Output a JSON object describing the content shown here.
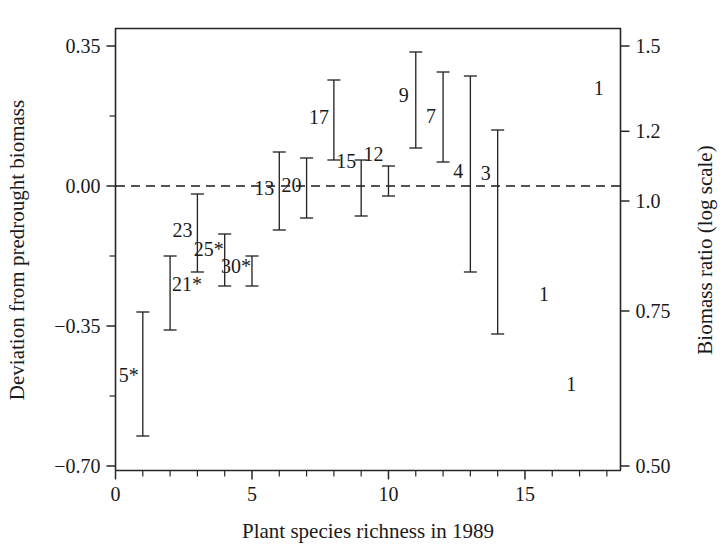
{
  "figure": {
    "background": "#ffffff",
    "ink_color": "#1a1a1a",
    "x_axis_title": "Plant species richness in 1989",
    "y_axis_title_left": "Deviation from predrought biomass",
    "y_axis_title_right": "Biomass ratio (log scale)"
  },
  "chart_data": {
    "type": "scatter",
    "title": "",
    "xlabel": "Plant species richness in 1989",
    "ylabel": "Deviation from predrought biomass",
    "ylabel_secondary": "Biomass ratio (log scale)",
    "xlim": [
      0,
      18.5
    ],
    "ylim": [
      -0.7,
      0.35
    ],
    "ylim_secondary": [
      0.5,
      1.5
    ],
    "grid": false,
    "legend": false,
    "reference_line": {
      "y": 0.0,
      "style": "dashed",
      "label": "0.00 / biomass ratio 1.0"
    },
    "xticks": [
      0,
      5,
      10,
      15
    ],
    "xtick_labels": [
      "0",
      "5",
      "10",
      "15"
    ],
    "xtick_minor_step": 1,
    "yticks_left": [
      0.35,
      0.0,
      -0.35,
      -0.7
    ],
    "ytick_labels_left": [
      "0.35",
      "0.00",
      "−0.35",
      "−0.70"
    ],
    "yticks_minor_left": [
      0.175,
      -0.175,
      -0.525
    ],
    "yticks_right": [
      1.5,
      1.2,
      1.0,
      0.75,
      0.5
    ],
    "ytick_labels_right": [
      "1.5",
      "1.2",
      "1.0",
      "0.75",
      "0.50"
    ],
    "point_label_note": "Numeric labels next to each error bar are plot/field identifiers; asterisks mark significance.",
    "points": [
      {
        "id": "5*",
        "label": "5*",
        "x": 1,
        "mean": -0.475,
        "low": -0.625,
        "high": -0.315,
        "label_dx": -14,
        "label_dy": 8
      },
      {
        "id": "21*",
        "label": "21*",
        "x": 2,
        "mean": -0.265,
        "low": -0.36,
        "high": -0.175,
        "label_dx": 17,
        "label_dy": -2
      },
      {
        "id": "23",
        "label": "23",
        "x": 3,
        "mean": -0.12,
        "low": -0.215,
        "high": -0.02,
        "label_dx": -15,
        "label_dy": 4
      },
      {
        "id": "25*",
        "label": "25*",
        "x": 4,
        "mean": -0.19,
        "low": -0.25,
        "high": -0.12,
        "label_dx": -16,
        "label_dy": -4
      },
      {
        "id": "30*",
        "label": "30*",
        "x": 5,
        "mean": -0.215,
        "low": -0.25,
        "high": -0.175,
        "label_dx": -16,
        "label_dy": 2
      },
      {
        "id": "13",
        "label": "13",
        "x": 6,
        "mean": 0.0,
        "low": -0.11,
        "high": 0.085,
        "label_dx": -15,
        "label_dy": 4
      },
      {
        "id": "20",
        "label": "20",
        "x": 7,
        "mean": 0.0,
        "low": -0.08,
        "high": 0.07,
        "label_dx": -15,
        "label_dy": 4
      },
      {
        "id": "17",
        "label": "17",
        "x": 8,
        "mean": 0.16,
        "low": 0.065,
        "high": 0.265,
        "label_dx": -15,
        "label_dy": 4
      },
      {
        "id": "15",
        "label": "15",
        "x": 9,
        "mean": 0.0,
        "low": -0.075,
        "high": 0.065,
        "label_dx": -15,
        "label_dy": -20
      },
      {
        "id": "12",
        "label": "12",
        "x": 10,
        "mean": 0.0,
        "low": -0.025,
        "high": 0.05,
        "label_dx": -15,
        "label_dy": -20
      },
      {
        "id": "9",
        "label": "9",
        "x": 11,
        "mean": 0.21,
        "low": 0.095,
        "high": 0.335,
        "label_dx": -12,
        "label_dy": 2
      },
      {
        "id": "7",
        "label": "7",
        "x": 12,
        "mean": 0.175,
        "low": 0.06,
        "high": 0.285,
        "label_dx": -12,
        "label_dy": 6
      },
      {
        "id": "4",
        "label": "4",
        "x": 13,
        "mean": 0.0,
        "low": -0.215,
        "high": 0.275,
        "label_dx": -12,
        "label_dy": 4
      },
      {
        "id": "3",
        "label": "3",
        "x": 14,
        "mean": -0.075,
        "low": -0.37,
        "high": 0.14,
        "label_dx": -12,
        "label_dy": -52
      }
    ],
    "lone_labels": [
      {
        "label": "1",
        "x": 17.7,
        "y": 0.245
      },
      {
        "label": "1",
        "x": 15.7,
        "y": -0.27
      },
      {
        "label": "1",
        "x": 16.7,
        "y": -0.495
      }
    ]
  }
}
